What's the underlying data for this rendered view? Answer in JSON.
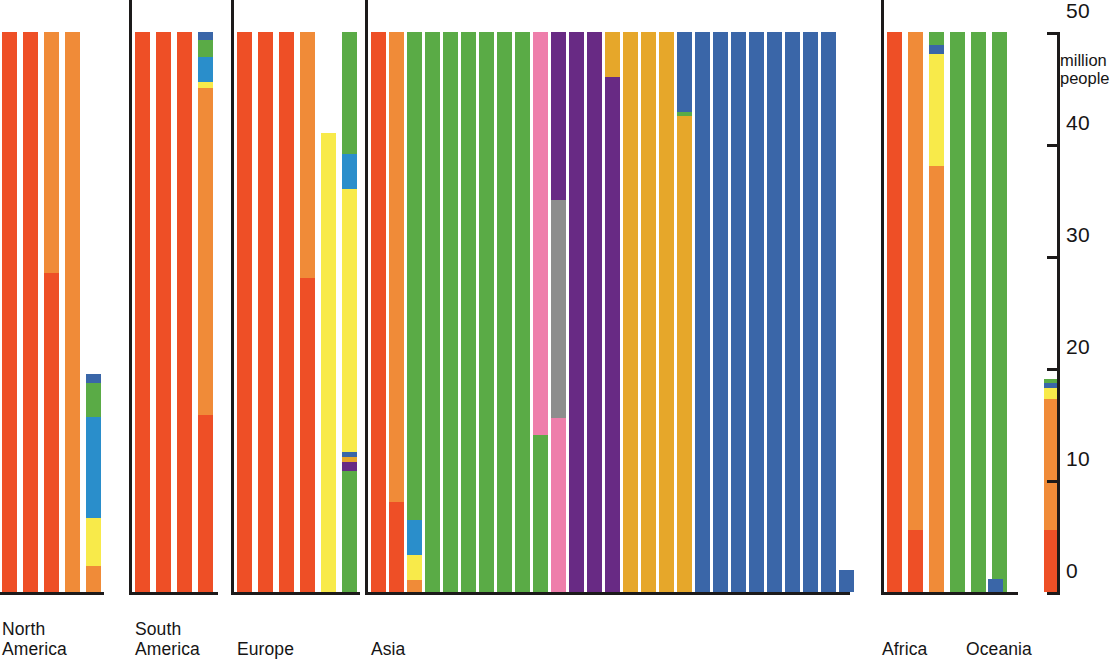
{
  "axis": {
    "unit_label": "million\npeople",
    "ticks": [
      {
        "value": 0,
        "label": "0"
      },
      {
        "value": 10,
        "label": "10"
      },
      {
        "value": 20,
        "label": "20"
      },
      {
        "value": 30,
        "label": "30"
      },
      {
        "value": 40,
        "label": "40"
      },
      {
        "value": 50,
        "label": "50"
      }
    ],
    "min": 0,
    "max": 50
  },
  "colors": {
    "red_orange": "#ee4f26",
    "orange": "#f08b38",
    "yellow": "#f8ea4a",
    "blue_light": "#2a8ecb",
    "green": "#5aab46",
    "blue_dark": "#3a66a8",
    "pink": "#ee7eab",
    "purple": "#682a84",
    "gold": "#e6a72a",
    "grey": "#8d8d8d",
    "axis": "#1c1a1a",
    "text": "#161515"
  },
  "chart_data": {
    "type": "bar",
    "title": "",
    "xlabel": "",
    "ylabel": "million people",
    "ylim": [
      0,
      50
    ],
    "grid": false,
    "legend": "none",
    "stacked": true,
    "note": "Stacked columns grouped by continent; each column is one country/entity, each stacked segment is a colour-coded sub-population. Values in million people read off the 0-50 right-hand axis.",
    "groups": [
      {
        "label": "North\nAmerica",
        "bars": [
          {
            "total": 50,
            "segments": [
              {
                "color": "red_orange",
                "value": 50
              }
            ]
          },
          {
            "total": 50,
            "segments": [
              {
                "color": "red_orange",
                "value": 50
              }
            ]
          },
          {
            "total": 50,
            "segments": [
              {
                "color": "red_orange",
                "value": 28.5
              },
              {
                "color": "orange",
                "value": 21.5
              }
            ]
          },
          {
            "total": 50,
            "segments": [
              {
                "color": "orange",
                "value": 50
              }
            ]
          },
          {
            "total": 19.5,
            "segments": [
              {
                "color": "orange",
                "value": 2.3
              },
              {
                "color": "yellow",
                "value": 4.3
              },
              {
                "color": "blue_light",
                "value": 9.0
              },
              {
                "color": "green",
                "value": 3.1
              },
              {
                "color": "blue_dark",
                "value": 0.8
              }
            ]
          }
        ]
      },
      {
        "label": "South\nAmerica",
        "bars": [
          {
            "total": 50,
            "segments": [
              {
                "color": "red_orange",
                "value": 50
              }
            ]
          },
          {
            "total": 50,
            "segments": [
              {
                "color": "red_orange",
                "value": 50
              }
            ]
          },
          {
            "total": 50,
            "segments": [
              {
                "color": "red_orange",
                "value": 50
              }
            ]
          },
          {
            "total": 50,
            "segments": [
              {
                "color": "red_orange",
                "value": 15.8
              },
              {
                "color": "orange",
                "value": 29.2
              },
              {
                "color": "yellow",
                "value": 0.5
              },
              {
                "color": "blue_light",
                "value": 2.3
              },
              {
                "color": "green",
                "value": 1.5
              },
              {
                "color": "blue_dark",
                "value": 0.7
              }
            ]
          }
        ]
      },
      {
        "label": "Europe",
        "bars": [
          {
            "total": 50,
            "segments": [
              {
                "color": "red_orange",
                "value": 50
              }
            ]
          },
          {
            "total": 50,
            "segments": [
              {
                "color": "red_orange",
                "value": 50
              }
            ]
          },
          {
            "total": 50,
            "segments": [
              {
                "color": "red_orange",
                "value": 50
              }
            ]
          },
          {
            "total": 50,
            "segments": [
              {
                "color": "red_orange",
                "value": 28.0
              },
              {
                "color": "orange",
                "value": 22.0
              }
            ]
          },
          {
            "total": 41,
            "segments": [
              {
                "color": "yellow",
                "value": 41
              }
            ]
          },
          {
            "total": 50,
            "segments": [
              {
                "color": "green",
                "value": 10.8
              },
              {
                "color": "purple",
                "value": 0.8
              },
              {
                "color": "gold",
                "value": 0.5
              },
              {
                "color": "blue_dark",
                "value": 0.4
              },
              {
                "color": "yellow",
                "value": 23.5
              },
              {
                "color": "blue_light",
                "value": 3.1
              },
              {
                "color": "green",
                "value": 10.9
              }
            ]
          }
        ]
      },
      {
        "label": "Asia",
        "bars": [
          {
            "total": 50,
            "segments": [
              {
                "color": "red_orange",
                "value": 50
              }
            ]
          },
          {
            "total": 50,
            "segments": [
              {
                "color": "red_orange",
                "value": 8.0
              },
              {
                "color": "orange",
                "value": 42.0
              }
            ]
          },
          {
            "total": 50,
            "segments": [
              {
                "color": "orange",
                "value": 1.1
              },
              {
                "color": "yellow",
                "value": 2.2
              },
              {
                "color": "blue_light",
                "value": 3.1
              },
              {
                "color": "green",
                "value": 43.6
              }
            ]
          },
          {
            "total": 50,
            "segments": [
              {
                "color": "green",
                "value": 50
              }
            ]
          },
          {
            "total": 50,
            "segments": [
              {
                "color": "green",
                "value": 50
              }
            ]
          },
          {
            "total": 50,
            "segments": [
              {
                "color": "green",
                "value": 50
              }
            ]
          },
          {
            "total": 50,
            "segments": [
              {
                "color": "green",
                "value": 50
              }
            ]
          },
          {
            "total": 50,
            "segments": [
              {
                "color": "green",
                "value": 50
              }
            ]
          },
          {
            "total": 50,
            "segments": [
              {
                "color": "green",
                "value": 50
              }
            ]
          },
          {
            "total": 50,
            "segments": [
              {
                "color": "green",
                "value": 14.0
              },
              {
                "color": "pink",
                "value": 36.0
              }
            ]
          },
          {
            "total": 50,
            "segments": [
              {
                "color": "pink",
                "value": 15.5
              },
              {
                "color": "grey",
                "value": 19.5
              },
              {
                "color": "purple",
                "value": 15.0
              }
            ]
          },
          {
            "total": 50,
            "segments": [
              {
                "color": "purple",
                "value": 50
              }
            ]
          },
          {
            "total": 50,
            "segments": [
              {
                "color": "purple",
                "value": 50
              }
            ]
          },
          {
            "total": 50,
            "segments": [
              {
                "color": "purple",
                "value": 46.0
              },
              {
                "color": "gold",
                "value": 4.0
              }
            ]
          },
          {
            "total": 50,
            "segments": [
              {
                "color": "gold",
                "value": 50
              }
            ]
          },
          {
            "total": 50,
            "segments": [
              {
                "color": "gold",
                "value": 50
              }
            ]
          },
          {
            "total": 50,
            "segments": [
              {
                "color": "gold",
                "value": 50
              }
            ]
          },
          {
            "total": 50,
            "segments": [
              {
                "color": "gold",
                "value": 42.5
              },
              {
                "color": "green",
                "value": 0.4
              },
              {
                "color": "blue_dark",
                "value": 7.1
              }
            ]
          },
          {
            "total": 50,
            "segments": [
              {
                "color": "blue_dark",
                "value": 50
              }
            ]
          },
          {
            "total": 50,
            "segments": [
              {
                "color": "blue_dark",
                "value": 50
              }
            ]
          },
          {
            "total": 50,
            "segments": [
              {
                "color": "blue_dark",
                "value": 50
              }
            ]
          },
          {
            "total": 50,
            "segments": [
              {
                "color": "blue_dark",
                "value": 50
              }
            ]
          },
          {
            "total": 50,
            "segments": [
              {
                "color": "blue_dark",
                "value": 50
              }
            ]
          },
          {
            "total": 50,
            "segments": [
              {
                "color": "blue_dark",
                "value": 50
              }
            ]
          },
          {
            "total": 50,
            "segments": [
              {
                "color": "blue_dark",
                "value": 50
              }
            ]
          },
          {
            "total": 50,
            "segments": [
              {
                "color": "blue_dark",
                "value": 50
              }
            ]
          },
          {
            "total": 2.0,
            "segments": [
              {
                "color": "blue_dark",
                "value": 2.0
              }
            ]
          }
        ]
      },
      {
        "label": "Africa",
        "bars": [
          {
            "total": 50,
            "segments": [
              {
                "color": "red_orange",
                "value": 50
              }
            ]
          },
          {
            "total": 50,
            "segments": [
              {
                "color": "red_orange",
                "value": 5.5
              },
              {
                "color": "orange",
                "value": 44.5
              }
            ]
          },
          {
            "total": 50,
            "segments": [
              {
                "color": "orange",
                "value": 38.0
              },
              {
                "color": "yellow",
                "value": 10.0
              },
              {
                "color": "blue_dark",
                "value": 0.8
              },
              {
                "color": "green",
                "value": 1.2
              }
            ]
          },
          {
            "total": 50,
            "segments": [
              {
                "color": "green",
                "value": 50
              }
            ]
          },
          {
            "total": 50,
            "segments": [
              {
                "color": "green",
                "value": 50
              }
            ]
          },
          {
            "total": 50,
            "segments": [
              {
                "color": "green",
                "value": 50
              }
            ]
          }
        ]
      },
      {
        "label": "Oceania",
        "bars": [
          {
            "total": 1.2,
            "segments": [
              {
                "color": "blue_dark",
                "value": 1.2
              }
            ]
          },
          {
            "total": 19.0,
            "segments": [
              {
                "color": "red_orange",
                "value": 5.5
              },
              {
                "color": "orange",
                "value": 11.7
              },
              {
                "color": "yellow",
                "value": 1.0
              },
              {
                "color": "blue_dark",
                "value": 0.5
              },
              {
                "color": "green",
                "value": 0.3
              }
            ]
          }
        ]
      }
    ]
  },
  "layout": {
    "groups": [
      {
        "left": 2,
        "bar_width": 15,
        "gap": 6,
        "axis_height": 598,
        "baseline_width": 108,
        "label_left": 2
      },
      {
        "left": 135,
        "bar_width": 15,
        "gap": 6,
        "axis_height": 598,
        "baseline_width": 89,
        "label_left": 135
      },
      {
        "left": 237,
        "bar_width": 15,
        "gap": 6,
        "axis_height": 598,
        "baseline_width": 129,
        "label_left": 237
      },
      {
        "left": 371,
        "bar_width": 15,
        "gap": 3,
        "axis_height": 598,
        "baseline_width": 485,
        "label_left": 371
      },
      {
        "left": 887,
        "bar_width": 15,
        "gap": 6,
        "axis_height": 598,
        "baseline_width": 137,
        "label_left": 882
      },
      {
        "left": 988,
        "bar_width": 15,
        "gap": 41,
        "axis_height": 0,
        "baseline_width": 0,
        "label_left": 966
      }
    ]
  }
}
